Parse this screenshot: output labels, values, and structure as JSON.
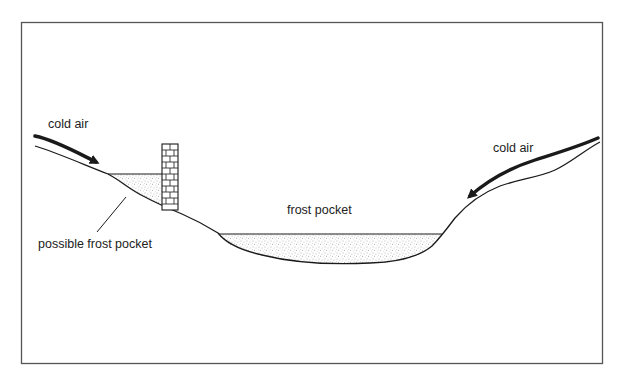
{
  "diagram": {
    "type": "cross-section",
    "labels": {
      "cold_air_left": "cold air",
      "cold_air_right": "cold air",
      "frost_pocket": "frost pocket",
      "possible_frost_pocket": "possible frost pocket"
    },
    "elements": [
      {
        "id": "left-slope",
        "kind": "terrain",
        "description": "hillside descending from left"
      },
      {
        "id": "wall",
        "kind": "obstacle",
        "description": "brick wall on left slope"
      },
      {
        "id": "wall-pocket",
        "kind": "stippled-fill",
        "description": "cold air pooled uphill of wall"
      },
      {
        "id": "valley-floor",
        "kind": "terrain",
        "description": "valley bottom"
      },
      {
        "id": "valley-pocket",
        "kind": "stippled-fill",
        "description": "cold air pooled in valley"
      },
      {
        "id": "right-slope",
        "kind": "terrain",
        "description": "hillside rising to right"
      },
      {
        "id": "arrow-left",
        "kind": "arrow",
        "description": "cold air flowing downslope from left"
      },
      {
        "id": "arrow-right",
        "kind": "arrow",
        "description": "cold air flowing downslope from right"
      }
    ],
    "colors": {
      "line": "#1a1a1a",
      "frame": "#555555",
      "stipple": "#6a6a6a",
      "background": "#ffffff"
    }
  }
}
